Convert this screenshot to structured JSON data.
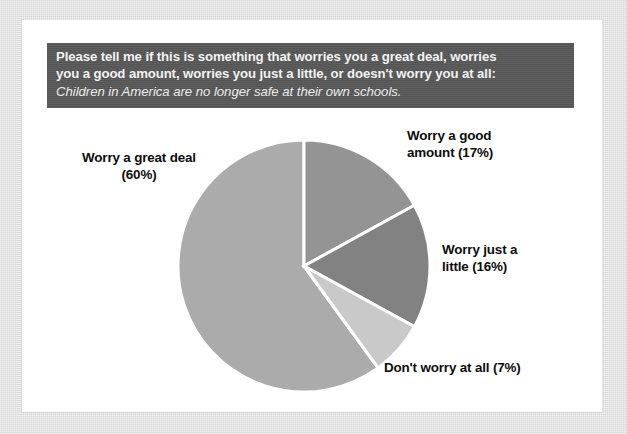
{
  "banner": {
    "question_line1": "Please tell me if this is something that worries you a great deal, worries",
    "question_line2": "you a good amount, worries you just a little, or doesn't worry you at all:",
    "statement": "Children in America are no longer safe at their own schools.",
    "background_color": "#595959",
    "text_color": "#f2f2f2"
  },
  "labels": {
    "great_deal": "Worry a great deal\n(60%)",
    "good_amount": "Worry a good\namount (17%)",
    "just_little": "Worry just a\nlittle (16%)",
    "dont_worry": "Don't worry at all (7%)"
  },
  "chart_data": {
    "type": "pie",
    "title": "Children in America are no longer safe at their own schools.",
    "subtitle": "Please tell me if this is something that worries you a great deal, worries you a good amount, worries you just a little, or doesn't worry you at all:",
    "categories": [
      "Worry a great deal",
      "Worry a good amount",
      "Worry just a little",
      "Don't worry at all"
    ],
    "values": [
      60,
      17,
      16,
      7
    ],
    "unit": "%",
    "colors": [
      "#ababab",
      "#949494",
      "#828282",
      "#c9c9c9"
    ],
    "slice_border_color": "#ffffff",
    "start_angle_deg": 0,
    "direction": "clockwise",
    "legend": "none",
    "data_labels": [
      "Worry a great deal (60%)",
      "Worry a good amount (17%)",
      "Worry just a little (16%)",
      "Don't worry at all (7%)"
    ],
    "center": {
      "x": 304,
      "y": 266
    },
    "radius": 126
  }
}
